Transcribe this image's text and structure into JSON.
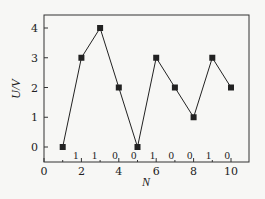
{
  "chart_data": {
    "type": "line",
    "title": "",
    "xlabel": "N",
    "ylabel": "U/V",
    "x": [
      1,
      2,
      3,
      4,
      5,
      6,
      7,
      8,
      9,
      10
    ],
    "series": [
      {
        "name": "U",
        "values": [
          0,
          3,
          4,
          2,
          0,
          3,
          2,
          1,
          3,
          2
        ],
        "marker": "square",
        "color": "#222222"
      }
    ],
    "xlim": [
      0,
      11
    ],
    "ylim": [
      -0.5,
      4.5
    ],
    "xticks": [
      0,
      2,
      4,
      6,
      8,
      10
    ],
    "yticks": [
      0,
      1,
      2,
      3,
      4
    ],
    "grid": false,
    "legend": null,
    "annotations": [
      {
        "text": "1",
        "x": 1.7
      },
      {
        "text": "1",
        "x": 2.7
      },
      {
        "text": "0",
        "x": 3.8
      },
      {
        "text": "0",
        "x": 4.8
      },
      {
        "text": "1",
        "x": 5.8
      },
      {
        "text": "0",
        "x": 6.8
      },
      {
        "text": "0",
        "x": 7.8
      },
      {
        "text": "1",
        "x": 8.8
      },
      {
        "text": "0",
        "x": 9.8
      }
    ]
  }
}
